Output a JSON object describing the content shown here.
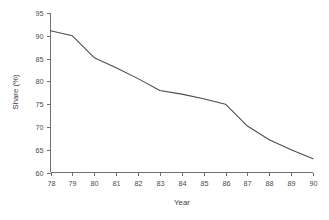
{
  "chart_data": {
    "type": "line",
    "title": "",
    "xlabel": "Year",
    "ylabel": "Share (%)",
    "x": [
      78,
      79,
      80,
      81,
      82,
      83,
      84,
      85,
      86,
      87,
      88,
      89,
      90
    ],
    "xtick_labels": [
      "78",
      "79",
      "80",
      "81",
      "82",
      "83",
      "84",
      "85",
      "86",
      "87",
      "88",
      "89",
      "90"
    ],
    "values": [
      91.1,
      90.0,
      85.2,
      83.0,
      80.6,
      78.0,
      77.2,
      76.2,
      75.0,
      70.2,
      67.2,
      65.0,
      63.0
    ],
    "ytick_labels": [
      "60",
      "65",
      "70",
      "75",
      "80",
      "85",
      "90",
      "95"
    ],
    "yticks": [
      60,
      65,
      70,
      75,
      80,
      85,
      90,
      95
    ],
    "xlim": [
      78,
      90
    ],
    "ylim": [
      60,
      95
    ],
    "grid": false,
    "legend": null,
    "series": [
      {
        "name": "Share",
        "values": [
          91.1,
          90.0,
          85.2,
          83.0,
          80.6,
          78.0,
          77.2,
          76.2,
          75.0,
          70.2,
          67.2,
          65.0,
          63.0
        ]
      }
    ],
    "colors": {
      "line": "#4b4b4b",
      "axis": "#6e6e6e",
      "text": "#4a4a4a",
      "background": "#ffffff"
    }
  }
}
